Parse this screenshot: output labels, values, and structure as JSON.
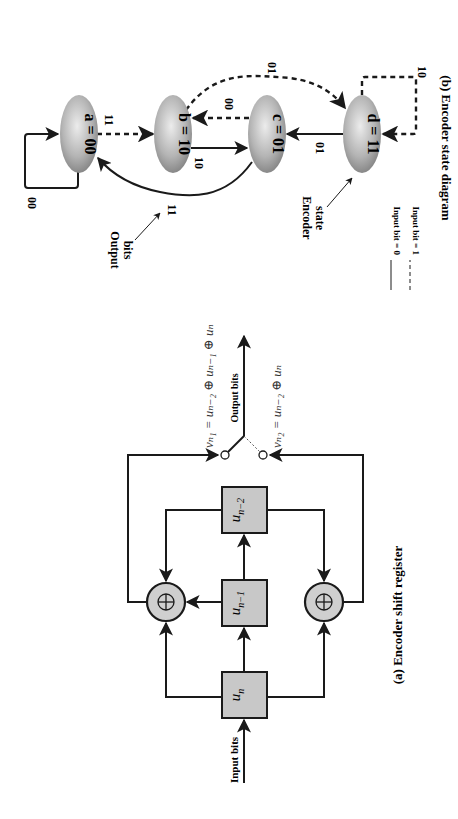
{
  "shift_register": {
    "caption": "(a) Encoder shift register",
    "input_label": "Input bits",
    "output_label": "Output bits",
    "registers": [
      {
        "label": "u",
        "sub": "n"
      },
      {
        "label": "u",
        "sub": "n−1"
      },
      {
        "label": "u",
        "sub": "n−2"
      }
    ],
    "adder_symbol": "⊕",
    "equation_1": "vₙ₁ = uₙ₋₂ ⊕ uₙ₋₁ ⊕ uₙ",
    "equation_2": "vₙ₂ = uₙ₋₂ ⊕ uₙ"
  },
  "state_diagram": {
    "caption": "(b) Encoder state diagram",
    "states": [
      {
        "id": "a",
        "label": "a = 00"
      },
      {
        "id": "b",
        "label": "b = 10"
      },
      {
        "id": "c",
        "label": "c = 01"
      },
      {
        "id": "d",
        "label": "d = 11"
      }
    ],
    "transitions": [
      {
        "from": "a",
        "to": "a",
        "output": "00",
        "input": 0
      },
      {
        "from": "a",
        "to": "b",
        "output": "11",
        "input": 1
      },
      {
        "from": "b",
        "to": "c",
        "output": "10",
        "input": 0
      },
      {
        "from": "b",
        "to": "d",
        "output": "01",
        "input": 1
      },
      {
        "from": "c",
        "to": "a",
        "output": "11",
        "input": 0
      },
      {
        "from": "c",
        "to": "b",
        "output": "00",
        "input": 1
      },
      {
        "from": "d",
        "to": "c",
        "output": "01",
        "input": 0
      },
      {
        "from": "d",
        "to": "d",
        "output": "10",
        "input": 1
      }
    ],
    "annotations": {
      "output_bits": [
        "Output",
        "bits"
      ],
      "encoder_state": [
        "Encoder",
        "state"
      ]
    },
    "legend": [
      {
        "style": "solid",
        "label": "Input bit = 0"
      },
      {
        "style": "dashed",
        "label": "Input bit = 1"
      }
    ]
  },
  "colors": {
    "line": "#1a1a1a",
    "box_fill": "#c8c8c8",
    "ellipse_light": "#e6e6e6",
    "ellipse_dark": "#8a8a8a"
  }
}
